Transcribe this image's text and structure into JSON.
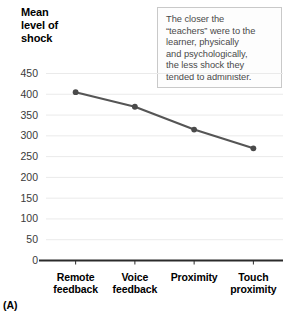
{
  "figure": {
    "label": "(A)"
  },
  "axis_title": {
    "line1": "Mean",
    "line2": "level of",
    "line3": "shock"
  },
  "annotation": {
    "line1": "The closer the",
    "line2": "“teachers” were to the",
    "line3": "learner, physically",
    "line4": "and psychologically,",
    "line5": "the less shock they",
    "line6": "tended to administer."
  },
  "colors": {
    "line": "#555555",
    "marker": "#4a4a4a",
    "gridline": "#eaeaea",
    "axis": "#2b2b2b",
    "tick_text": "#3a3a3a",
    "callout_border": "#c9c9c9",
    "callout_text": "#4a4a4a"
  },
  "chart_data": {
    "type": "line",
    "title": "Mean level of shock",
    "xlabel": "",
    "ylabel": "Mean level of shock",
    "categories": [
      "Remote feedback",
      "Voice feedback",
      "Proximity",
      "Touch proximity"
    ],
    "category_lines": [
      [
        "Remote",
        "feedback"
      ],
      [
        "Voice",
        "feedback"
      ],
      [
        "Proximity",
        ""
      ],
      [
        "Touch",
        "proximity"
      ]
    ],
    "values": [
      405,
      370,
      315,
      270
    ],
    "ylim": [
      0,
      450
    ],
    "ytick_values": [
      0,
      50,
      100,
      150,
      200,
      250,
      300,
      350,
      400,
      450
    ],
    "ytick_labels": [
      "0",
      "50",
      "100",
      "150",
      "200",
      "250",
      "300",
      "350",
      "400",
      "450"
    ],
    "grid": true,
    "legend": "none",
    "markers": true,
    "annotations": [
      "The closer the “teachers” were to the learner, physically and psychologically, the less shock they tended to administer."
    ]
  }
}
